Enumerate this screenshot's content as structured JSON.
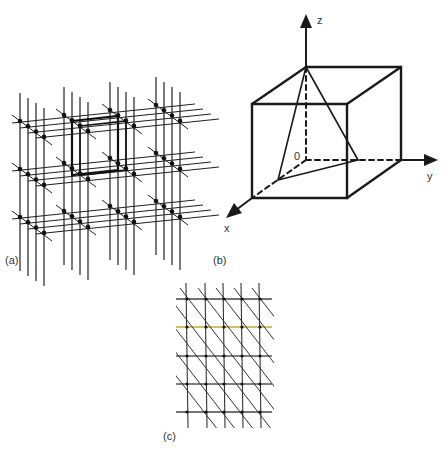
{
  "figure": {
    "panels": [
      {
        "id": "a",
        "label": "(a)",
        "description": "3D lattice of grid lines with dots, highlighted cube"
      },
      {
        "id": "b",
        "label": "(b)",
        "description": "Cube with axes and inscribed triangle"
      },
      {
        "id": "c",
        "label": "(c)",
        "description": "2D grid with diagonal lines"
      }
    ],
    "axes_b": {
      "z": "z",
      "y": "y",
      "x": "x",
      "origin": "0"
    }
  },
  "colors": {
    "line": "#1a1a1a",
    "dot": "#111111",
    "label": "#333333",
    "accent_yellow": "#e8c840",
    "accent_pink": "#c080b0",
    "accent_green": "#70a070"
  }
}
